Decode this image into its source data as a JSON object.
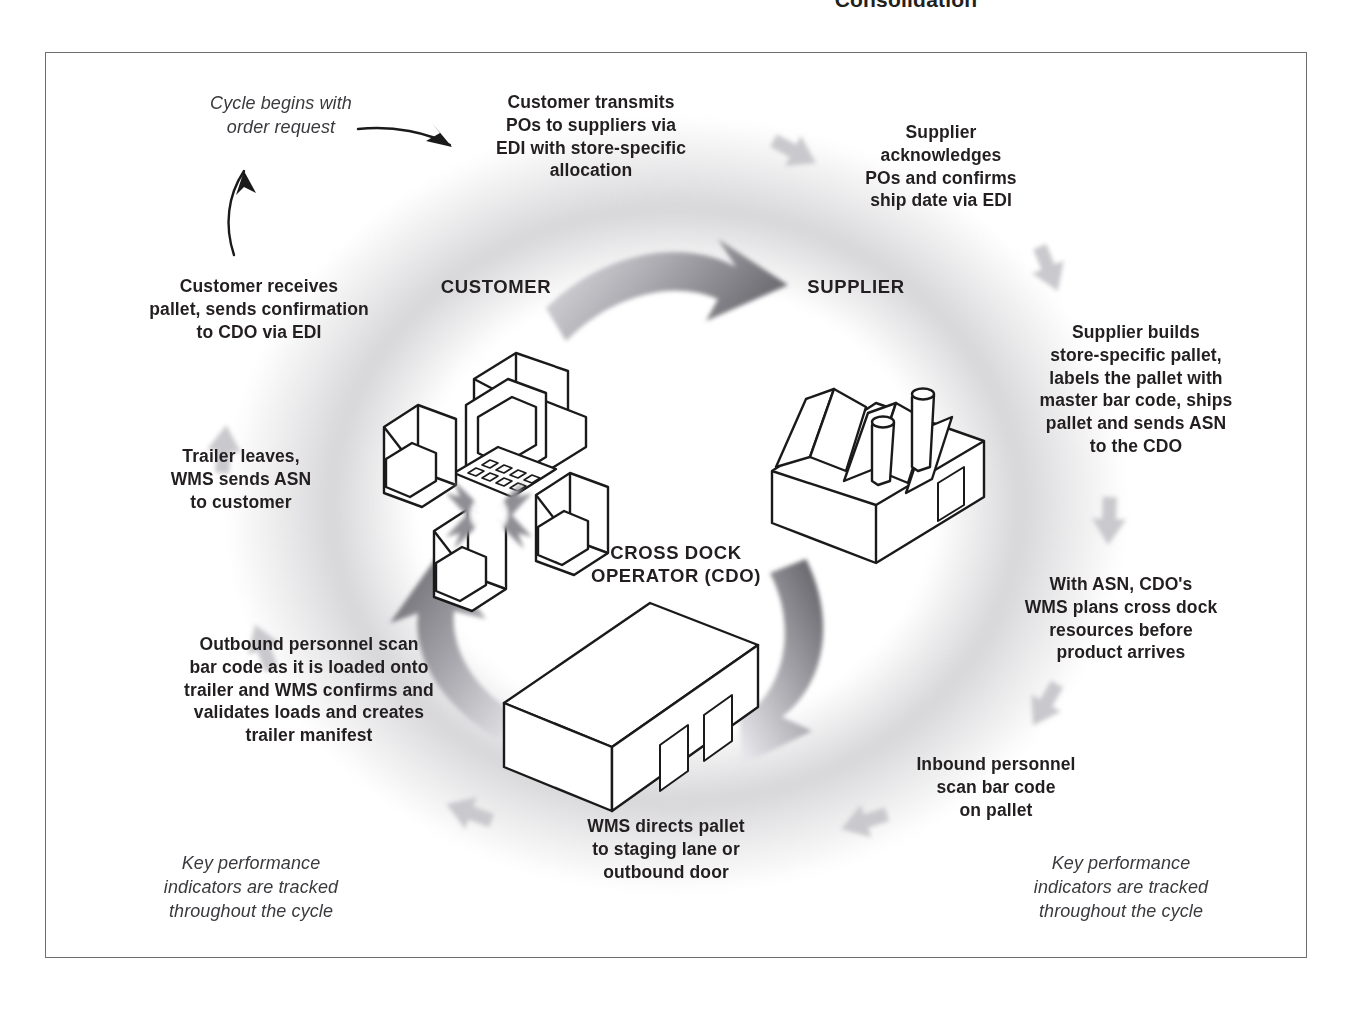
{
  "page": {
    "header_clipped": "Consolidation",
    "diagram_title": "Cross Dock / Consolidation Cycle"
  },
  "actors": [
    {
      "id": "customer",
      "label": "CUSTOMER",
      "icon": "customer-terminal-stores-icon"
    },
    {
      "id": "supplier",
      "label": "SUPPLIER",
      "icon": "factory-icon"
    },
    {
      "id": "cdo",
      "label": "CROSS DOCK\nOPERATOR (CDO)",
      "line1": "CROSS DOCK",
      "line2": "OPERATOR (CDO)",
      "icon": "warehouse-icon"
    }
  ],
  "annotations": {
    "start": "Cycle begins with\norder request",
    "kpi_left": "Key performance\nindicators are tracked\nthroughout the cycle",
    "kpi_right": "Key performance\nindicators are tracked\nthroughout the cycle"
  },
  "steps": [
    {
      "n": 1,
      "id": "customer-transmits-pos",
      "text": "Customer transmits\nPOs to suppliers via\nEDI with store-specific\nallocation"
    },
    {
      "n": 2,
      "id": "supplier-acknowledges",
      "text": "Supplier\nacknowledges\nPOs and confirms\nship date via EDI"
    },
    {
      "n": 3,
      "id": "supplier-builds-pallet",
      "text": "Supplier builds\nstore-specific pallet,\nlabels the pallet with\nmaster bar code, ships\npallet and sends ASN\nto the CDO"
    },
    {
      "n": 4,
      "id": "wms-plans-cross-dock",
      "text": "With ASN, CDO's\nWMS plans cross dock\nresources before\nproduct arrives"
    },
    {
      "n": 5,
      "id": "inbound-scan",
      "text": "Inbound personnel\nscan bar code\non pallet"
    },
    {
      "n": 6,
      "id": "wms-directs-pallet",
      "text": "WMS directs pallet\nto staging lane or\noutbound door"
    },
    {
      "n": 7,
      "id": "outbound-scan",
      "text": "Outbound personnel scan\nbar code as it is loaded onto\ntrailer and WMS confirms and\nvalidates loads and creates\ntrailer manifest"
    },
    {
      "n": 8,
      "id": "trailer-leaves",
      "text": "Trailer leaves,\nWMS sends ASN\nto customer"
    },
    {
      "n": 9,
      "id": "customer-receives-pallet",
      "text": "Customer receives\npallet, sends confirmation\nto CDO via EDI"
    }
  ],
  "colors": {
    "text": "#231f20",
    "frame_border": "#6e6e72",
    "ring_grey": "#b2b2b7",
    "chevron_grey": "#c9c9cd",
    "arrow_dark": "#6b6b70",
    "arrow_light": "#d6d6da",
    "line_black": "#1a1a1a",
    "background": "#ffffff"
  }
}
